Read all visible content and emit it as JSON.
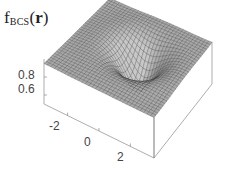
{
  "chart_data": {
    "type": "surface3d",
    "title_parts": {
      "main": "f",
      "subscript": "BCS",
      "open": "(",
      "arg": "r",
      "close": ")"
    },
    "zlabel": "f_BCS(r)",
    "xlabel": "",
    "ylabel": "",
    "x_ticks": [
      "-2",
      "0",
      "2"
    ],
    "x_tick_values": [
      -2,
      0,
      2
    ],
    "z_ticks": [
      "0.8",
      "0.6"
    ],
    "z_tick_values": [
      0.8,
      0.6
    ],
    "xlim": [
      -3.5,
      3.5
    ],
    "ylim": [
      -3.5,
      3.5
    ],
    "zlim": [
      0.5,
      1.0
    ],
    "grid": false,
    "legend": null,
    "surface_model": {
      "plateau": 0.95,
      "dip_center": [
        0.4,
        0.3
      ],
      "dip_depth": 0.42,
      "dip_width": 1.1,
      "grid_n": 32
    },
    "colors": {
      "mesh": "#333333",
      "fill": "#a8a8a8",
      "box": "#8a8a8a",
      "text": "#444444"
    }
  }
}
